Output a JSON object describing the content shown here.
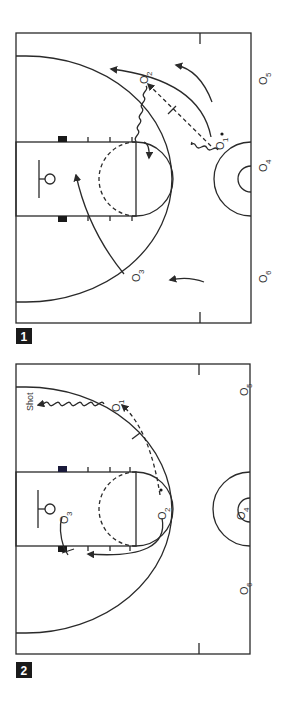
{
  "diagrams": [
    {
      "number": "1",
      "players": [
        {
          "id": "O1",
          "sub": "1"
        },
        {
          "id": "O2",
          "sub": "2"
        },
        {
          "id": "O3",
          "sub": "3"
        },
        {
          "id": "O4",
          "sub": "4"
        },
        {
          "id": "O5",
          "sub": "5"
        },
        {
          "id": "O6",
          "sub": "6"
        }
      ]
    },
    {
      "number": "2",
      "shot_label": "Shot",
      "players": [
        {
          "id": "O1",
          "sub": "1"
        },
        {
          "id": "O2",
          "sub": "2"
        },
        {
          "id": "O3",
          "sub": "3"
        },
        {
          "id": "O4",
          "sub": "4"
        },
        {
          "id": "O5",
          "sub": "5"
        },
        {
          "id": "O6",
          "sub": "6"
        }
      ]
    }
  ],
  "player_symbol": "O",
  "colors": {
    "ink": "#2a2a2a",
    "badge": "#1a1a1a",
    "background": "#ffffff"
  }
}
